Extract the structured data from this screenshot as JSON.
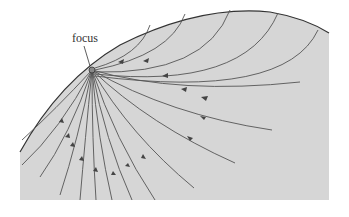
{
  "figure": {
    "label_focus": "focus",
    "region_fill": "#d6d6d6",
    "line_color": "#555555",
    "focus_point": {
      "x": 92,
      "y": 70
    }
  }
}
